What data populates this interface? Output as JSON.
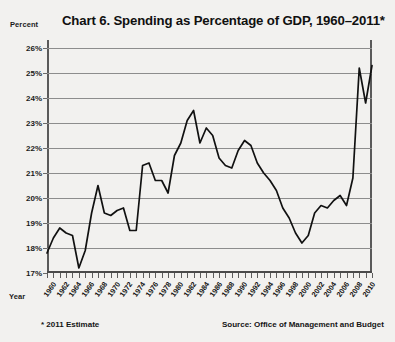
{
  "title": "Chart 6. Spending as Percentage of GDP, 1960–2011*",
  "y_axis_name": "Percent",
  "x_axis_name": "Year",
  "footnotes": {
    "estimate": "* 2011 Estimate",
    "source": "Source: Office of Management and Budget"
  },
  "chart_data": {
    "type": "line",
    "title": "Chart 6. Spending as Percentage of GDP, 1960–2011*",
    "xlabel": "Year",
    "ylabel": "Percent",
    "ylim": [
      17,
      26
    ],
    "xlim": [
      1960,
      2011
    ],
    "grid": true,
    "legend": false,
    "line_color": "#111111",
    "ytick_labels": [
      "26%",
      "25%",
      "24%",
      "23%",
      "22%",
      "21%",
      "20%",
      "19%",
      "18%",
      "17%"
    ],
    "ytick_values": [
      26,
      25,
      24,
      23,
      22,
      21,
      20,
      19,
      18,
      17
    ],
    "xtick_labels": [
      "1960",
      "1962",
      "1964",
      "1966",
      "1968",
      "1970",
      "1972",
      "1974",
      "1976",
      "1978",
      "1980",
      "1982",
      "1984",
      "1986",
      "1988",
      "1990",
      "1992",
      "1994",
      "1996",
      "1998",
      "2000",
      "2002",
      "2004",
      "2006",
      "2008",
      "2010"
    ],
    "xtick_values": [
      1960,
      1962,
      1964,
      1966,
      1968,
      1970,
      1972,
      1974,
      1976,
      1978,
      1980,
      1982,
      1984,
      1986,
      1988,
      1990,
      1992,
      1994,
      1996,
      1998,
      2000,
      2002,
      2004,
      2006,
      2008,
      2010
    ],
    "x": [
      1960,
      1961,
      1962,
      1963,
      1964,
      1965,
      1966,
      1967,
      1968,
      1969,
      1970,
      1971,
      1972,
      1973,
      1974,
      1975,
      1976,
      1977,
      1978,
      1979,
      1980,
      1981,
      1982,
      1983,
      1984,
      1985,
      1986,
      1987,
      1988,
      1989,
      1990,
      1991,
      1992,
      1993,
      1994,
      1995,
      1996,
      1997,
      1998,
      1999,
      2000,
      2001,
      2002,
      2003,
      2004,
      2005,
      2006,
      2007,
      2008,
      2009,
      2010,
      2011
    ],
    "values": [
      17.8,
      18.4,
      18.8,
      18.6,
      18.5,
      17.2,
      17.9,
      19.4,
      20.5,
      19.4,
      19.3,
      19.5,
      19.6,
      18.7,
      18.7,
      21.3,
      21.4,
      20.7,
      20.7,
      20.2,
      21.7,
      22.2,
      23.1,
      23.5,
      22.2,
      22.8,
      22.5,
      21.6,
      21.3,
      21.2,
      21.9,
      22.3,
      22.1,
      21.4,
      21.0,
      20.7,
      20.3,
      19.6,
      19.2,
      18.6,
      18.2,
      18.5,
      19.4,
      19.7,
      19.6,
      19.9,
      20.1,
      19.7,
      20.8,
      25.2,
      23.8,
      25.3
    ]
  }
}
